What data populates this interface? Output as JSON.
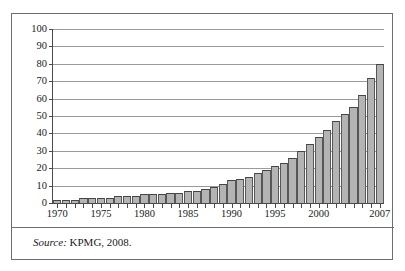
{
  "figure": {
    "source_prefix": "Source:",
    "source_text": " KPMG, 2008.",
    "frame_color": "#6e6e6e"
  },
  "chart_data": {
    "type": "bar",
    "title": "",
    "subtitle": "",
    "xlabel": "",
    "ylabel": "percentages",
    "ylim": [
      0,
      100
    ],
    "ytick_labels": [
      "0",
      "10",
      "20",
      "30",
      "40",
      "50",
      "60",
      "70",
      "80",
      "90",
      "100"
    ],
    "ytick_values": [
      0,
      10,
      20,
      30,
      40,
      50,
      60,
      70,
      80,
      90,
      100
    ],
    "xtick_labels": [
      "1970",
      "1975",
      "1980",
      "1985",
      "1990",
      "1995",
      "2000",
      "2007"
    ],
    "xtick_values": [
      1970,
      1975,
      1980,
      1985,
      1990,
      1995,
      2000,
      2007
    ],
    "grid": true,
    "legend": null,
    "bar_fill_color": "#b4b4b4",
    "bar_edge_color": "#575757",
    "categories": [
      "1970",
      "1971",
      "1972",
      "1973",
      "1974",
      "1975",
      "1976",
      "1977",
      "1978",
      "1979",
      "1980",
      "1981",
      "1982",
      "1983",
      "1984",
      "1985",
      "1986",
      "1987",
      "1988",
      "1989",
      "1990",
      "1991",
      "1992",
      "1993",
      "1994",
      "1995",
      "1996",
      "1997",
      "1998",
      "1999",
      "2000",
      "2001",
      "2002",
      "2003",
      "2004",
      "2005",
      "2006",
      "2007"
    ],
    "values": [
      2,
      2,
      2,
      3,
      3,
      3,
      3,
      4,
      4,
      4,
      5,
      5,
      5,
      6,
      6,
      7,
      7,
      8,
      9,
      11,
      13,
      14,
      15,
      17,
      19,
      21,
      23,
      26,
      30,
      34,
      38,
      42,
      47,
      51,
      55,
      62,
      72,
      80
    ],
    "last_value_label": "85"
  }
}
